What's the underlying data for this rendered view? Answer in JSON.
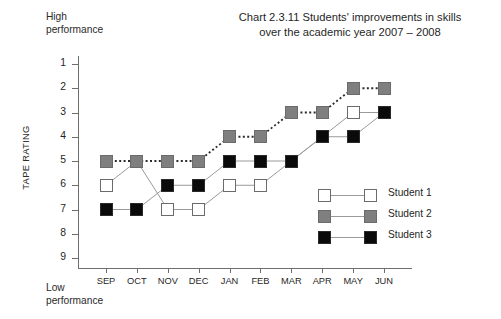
{
  "chart_data": {
    "type": "line",
    "title": "Chart 2.3.11  Students' improvements in skills\nover the academic year 2007 – 2008",
    "xlabel": "",
    "ylabel": "TAPE RATING",
    "categories": [
      "SEP",
      "OCT",
      "NOV",
      "DEC",
      "JAN",
      "FEB",
      "MAR",
      "APR",
      "MAY",
      "JUN"
    ],
    "ytick_labels": [
      "1",
      "2",
      "3",
      "4",
      "5",
      "6",
      "7",
      "8",
      "9"
    ],
    "ylim": [
      1,
      9
    ],
    "y_inverted": true,
    "grid": false,
    "legend_position": "inside-right",
    "axis_top_note": "High\nperformance",
    "axis_bottom_note": "Low\nperformance",
    "series": [
      {
        "name": "Student 1",
        "values": [
          6,
          5,
          7,
          7,
          6,
          6,
          5,
          4,
          3,
          3
        ],
        "marker": "square",
        "marker_fill": "#ffffff",
        "marker_edge": "#6b6b6b",
        "line_style": "solid",
        "line_color": "#9a9a9a"
      },
      {
        "name": "Student 2",
        "values": [
          5,
          5,
          5,
          5,
          4,
          4,
          3,
          3,
          2,
          2
        ],
        "marker": "square",
        "marker_fill": "#7f7f7f",
        "marker_edge": "#6b6b6b",
        "line_style": "dotted",
        "line_color": "#2b2b2b"
      },
      {
        "name": "Student 3",
        "values": [
          7,
          7,
          6,
          6,
          5,
          5,
          5,
          4,
          4,
          3
        ],
        "marker": "square",
        "marker_fill": "#0a0a0a",
        "marker_edge": "#2a2a2a",
        "line_style": "solid",
        "line_color": "#9a9a9a"
      }
    ]
  },
  "colors": {
    "axis": "#6e6e6e",
    "text": "#1f1f1f",
    "background": "#ffffff"
  }
}
